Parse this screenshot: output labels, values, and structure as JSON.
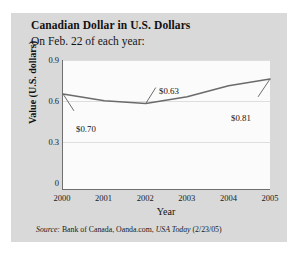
{
  "card": {
    "background_color": "#d9d9d9"
  },
  "chart_data": {
    "type": "line",
    "title": "Canadian Dollar in U.S. Dollars",
    "subtitle": "On Feb. 22 of each year:",
    "xlabel": "Year",
    "ylabel": "Value (U.S. dollars)",
    "categories": [
      "2000",
      "2001",
      "2002",
      "2003",
      "2004",
      "2005"
    ],
    "values": [
      0.7,
      0.65,
      0.63,
      0.68,
      0.76,
      0.81
    ],
    "x": [
      2000,
      2001,
      2002,
      2003,
      2004,
      2005
    ],
    "xlim": [
      2000,
      2005
    ],
    "ylim": [
      0,
      0.95
    ],
    "y_ticks": [
      "0",
      "0.3",
      "0.6",
      "0.9"
    ],
    "y_tick_values": [
      0,
      0.3,
      0.6,
      0.9
    ],
    "x_ticks": [
      "2000",
      "2001",
      "2002",
      "2003",
      "2004",
      "2005"
    ],
    "grid": "horizontal",
    "legend": "none",
    "line_color": "#6b6b6b",
    "plot_background": "#fbfbfb",
    "annotations": [
      {
        "label": "$0.70",
        "point_year": 2000,
        "point_value": 0.7
      },
      {
        "label": "$0.63",
        "point_year": 2002,
        "point_value": 0.63
      },
      {
        "label": "$0.81",
        "point_year": 2005,
        "point_value": 0.81
      }
    ]
  },
  "source": {
    "prefix": "Source:",
    "text": " Bank of Canada, Oanda.com, ",
    "publication": "USA Today",
    "date": " (2/23/05)"
  }
}
